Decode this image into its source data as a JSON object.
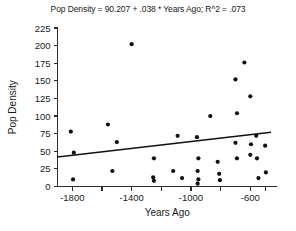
{
  "chart_data": {
    "type": "scatter",
    "title": "Pop Density = 90.207 + .038 * Years Ago; R^2 = .073",
    "xlabel": "Years Ago",
    "ylabel": "Pop Density",
    "xlim": [
      -1900,
      -420
    ],
    "ylim": [
      0,
      225
    ],
    "grid": false,
    "legend": null,
    "y_ticks": [
      0,
      25,
      50,
      75,
      100,
      125,
      150,
      175,
      200,
      225
    ],
    "y_tick_labels": [
      "0",
      "25",
      "50",
      "75",
      "100",
      "125",
      "150",
      "175",
      "200",
      "225"
    ],
    "x_ticks": [
      -1800,
      -1600,
      -1400,
      -1200,
      -1000,
      -800,
      -600,
      -500
    ],
    "x_tick_labels": [
      "-1800",
      "",
      "-1400",
      "",
      "-1000",
      "",
      "-600",
      ""
    ],
    "x_labeled_ticks": [
      -1800,
      -1400,
      -1000,
      -600
    ],
    "regression": {
      "equation": "Pop Density = 90.207 + .038 * Years Ago",
      "intercept": 90.207,
      "slope": 0.038,
      "r_squared": 0.073,
      "line_endpoints": [
        {
          "x": -1900,
          "y": 42
        },
        {
          "x": -460,
          "y": 77
        }
      ]
    },
    "points": [
      {
        "x": -1810,
        "y": 78
      },
      {
        "x": -1790,
        "y": 48
      },
      {
        "x": -1795,
        "y": 10
      },
      {
        "x": -1560,
        "y": 88
      },
      {
        "x": -1500,
        "y": 63
      },
      {
        "x": -1530,
        "y": 22
      },
      {
        "x": -1400,
        "y": 202
      },
      {
        "x": -1250,
        "y": 40
      },
      {
        "x": -1255,
        "y": 13
      },
      {
        "x": -1250,
        "y": 8
      },
      {
        "x": -1120,
        "y": 22
      },
      {
        "x": -1090,
        "y": 72
      },
      {
        "x": -1060,
        "y": 12
      },
      {
        "x": -960,
        "y": 70
      },
      {
        "x": -950,
        "y": 40
      },
      {
        "x": -955,
        "y": 22
      },
      {
        "x": -950,
        "y": 10
      },
      {
        "x": -955,
        "y": 4
      },
      {
        "x": -870,
        "y": 100
      },
      {
        "x": -820,
        "y": 35
      },
      {
        "x": -810,
        "y": 18
      },
      {
        "x": -805,
        "y": 9
      },
      {
        "x": -700,
        "y": 152
      },
      {
        "x": -690,
        "y": 104
      },
      {
        "x": -700,
        "y": 62
      },
      {
        "x": -690,
        "y": 40
      },
      {
        "x": -640,
        "y": 176
      },
      {
        "x": -600,
        "y": 128
      },
      {
        "x": -595,
        "y": 60
      },
      {
        "x": -600,
        "y": 45
      },
      {
        "x": -560,
        "y": 72
      },
      {
        "x": -555,
        "y": 40
      },
      {
        "x": -545,
        "y": 12
      },
      {
        "x": -500,
        "y": 58
      },
      {
        "x": -495,
        "y": 20
      }
    ]
  }
}
